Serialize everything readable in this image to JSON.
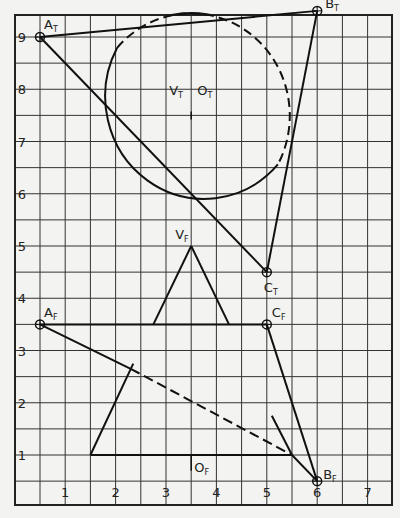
{
  "diagram": {
    "type": "descriptive-geometry-grid",
    "grid": {
      "x_min": 0,
      "x_max": 7.5,
      "y_min": 0,
      "y_max": 9.5,
      "minor_step": 0.5
    },
    "x_axis_labels": [
      "1",
      "2",
      "3",
      "4",
      "5",
      "6",
      "7"
    ],
    "y_axis_labels": [
      "1",
      "2",
      "3",
      "4",
      "5",
      "6",
      "7",
      "8",
      "9"
    ],
    "top_view": {
      "points": [
        {
          "name": "A",
          "sub": "T",
          "x": 0.5,
          "y": 9.0
        },
        {
          "name": "B",
          "sub": "T",
          "x": 6.0,
          "y": 9.5
        },
        {
          "name": "C",
          "sub": "T",
          "x": 5.0,
          "y": 4.5
        }
      ],
      "circle": {
        "label_v": "V",
        "label_o": "O",
        "sub": "T",
        "cx": 3.5,
        "cy": 7.5,
        "r": 2.0
      },
      "labels": {
        "vt": "V",
        "ot": "O",
        "sub": "T"
      }
    },
    "front_view": {
      "points": [
        {
          "name": "A",
          "sub": "F",
          "x": 0.5,
          "y": 3.5
        },
        {
          "name": "C",
          "sub": "F",
          "x": 5.0,
          "y": 3.5
        },
        {
          "name": "B",
          "sub": "F",
          "x": 6.0,
          "y": 0.5
        }
      ],
      "cone_apex": {
        "name": "V",
        "sub": "F",
        "x": 3.5,
        "y": 5.0
      },
      "base": {
        "name": "O",
        "sub": "F",
        "x": 3.5,
        "y": 1.0
      }
    }
  }
}
